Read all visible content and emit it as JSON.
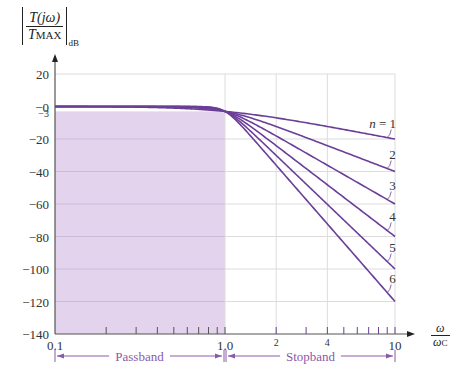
{
  "chart_data": {
    "type": "line",
    "title": "",
    "ylabel": "|T(jω)/T_MAX|_dB",
    "xlabel": "ω/ω_C",
    "xscale": "log",
    "xlim": [
      0.1,
      10
    ],
    "ylim": [
      -140,
      20
    ],
    "grid": true,
    "x_tick_labels": [
      "0.1",
      "1.0",
      "2",
      "4",
      "10"
    ],
    "x_tick_values": [
      0.1,
      1.0,
      2,
      4,
      10
    ],
    "y_tick_labels": [
      "20",
      "−0",
      "−3",
      "−20",
      "−40",
      "−60",
      "−80",
      "−100",
      "−120",
      "−140"
    ],
    "y_tick_values": [
      20,
      0,
      -3,
      -20,
      -40,
      -60,
      -80,
      -100,
      -120,
      -140
    ],
    "series": [
      {
        "name": "n = 1",
        "order": 1,
        "x": [
          0.1,
          1.0,
          10
        ],
        "values": [
          0,
          -3,
          -20
        ]
      },
      {
        "name": "2",
        "order": 2,
        "x": [
          0.1,
          1.0,
          10
        ],
        "values": [
          0,
          -3,
          -40
        ]
      },
      {
        "name": "3",
        "order": 3,
        "x": [
          0.1,
          1.0,
          10
        ],
        "values": [
          0,
          -3,
          -60
        ]
      },
      {
        "name": "4",
        "order": 4,
        "x": [
          0.1,
          1.0,
          10
        ],
        "values": [
          0,
          -3,
          -80
        ]
      },
      {
        "name": "5",
        "order": 5,
        "x": [
          0.1,
          1.0,
          10
        ],
        "values": [
          0,
          -3,
          -100
        ]
      },
      {
        "name": "6",
        "order": 6,
        "x": [
          0.1,
          1.0,
          10
        ],
        "values": [
          0,
          -3,
          -120
        ]
      }
    ],
    "shaded_region": {
      "label": "Passband",
      "x": [
        0.1,
        1.0
      ],
      "y": [
        -140,
        -3
      ]
    },
    "annotations": [
      {
        "text": "Passband",
        "x_range": [
          0.1,
          1.0
        ]
      },
      {
        "text": "Stopband",
        "x_range": [
          1.0,
          10
        ]
      }
    ]
  },
  "labels": {
    "y_num": "T(jω)",
    "y_den": "T",
    "y_den_sub": "MAX",
    "y_db": "dB",
    "x_num": "ω",
    "x_den": "ω",
    "x_den_sub": "C",
    "passband": "Passband",
    "stopband": "Stopband"
  },
  "colors": {
    "curve": "#6b3f98",
    "fill": "#e3d3ec",
    "grid": "#dcdcdc",
    "fill_grid": "#cdb9d8",
    "axis": "#555555",
    "band_label": "#8a5aa8"
  }
}
